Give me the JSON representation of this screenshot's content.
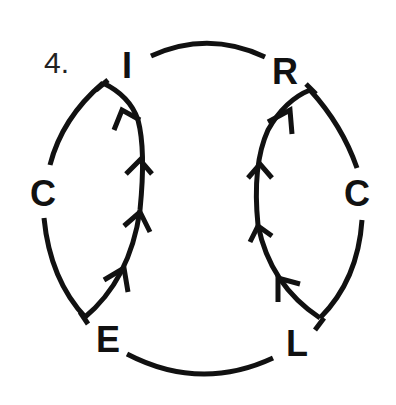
{
  "problem": {
    "number": "4."
  },
  "nodes": [
    {
      "id": "top-left",
      "letter": "I"
    },
    {
      "id": "top-right",
      "letter": "R"
    },
    {
      "id": "left",
      "letter": "C"
    },
    {
      "id": "right",
      "letter": "C"
    },
    {
      "id": "bottom-left",
      "letter": "E"
    },
    {
      "id": "bottom-right",
      "letter": "L"
    }
  ],
  "edges": [
    {
      "from": "I",
      "to": "R",
      "type": "arc"
    },
    {
      "from": "I",
      "to": "C",
      "type": "arc"
    },
    {
      "from": "C",
      "to": "E",
      "type": "arc"
    },
    {
      "from": "E",
      "to": "I",
      "type": "arrow-path",
      "arrows": 4,
      "direction": "up"
    },
    {
      "from": "E",
      "to": "L",
      "type": "arc"
    },
    {
      "from": "R",
      "to": "C",
      "type": "arc"
    },
    {
      "from": "C",
      "to": "L",
      "type": "arc"
    },
    {
      "from": "L",
      "to": "R",
      "type": "arrow-path",
      "arrows": 4,
      "direction": "up"
    }
  ],
  "colors": {
    "ink": "#111111",
    "background": "#ffffff"
  }
}
